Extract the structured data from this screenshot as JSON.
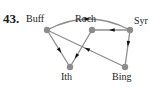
{
  "figure": {
    "problem_number": "43.",
    "type": "directed-graph",
    "width": 149,
    "height": 87,
    "background_color": "#ffffff",
    "node_color": "#8d8d8d",
    "edge_color": "#8d8d8d",
    "arrowhead_color": "#111111",
    "label_color": "#1a1a1a",
    "node_radius": 3.2,
    "edge_width": 1.3
  },
  "nodes": [
    {
      "id": "buff",
      "label": "Buff",
      "x": 47,
      "y": 30,
      "label_pos": "top-left"
    },
    {
      "id": "roch",
      "label": "Roch",
      "x": 92,
      "y": 30,
      "label_pos": "top"
    },
    {
      "id": "syr",
      "label": "Syr",
      "x": 130,
      "y": 30,
      "label_pos": "right"
    },
    {
      "id": "ith",
      "label": "Ith",
      "x": 70,
      "y": 67,
      "label_pos": "bottom"
    },
    {
      "id": "bing",
      "label": "Bing",
      "x": 125,
      "y": 67,
      "label_pos": "bottom"
    }
  ],
  "edges": [
    {
      "id": "buff-syr",
      "from": "buff",
      "to": "syr",
      "from_label": "Buff",
      "to_label": "Syr",
      "shape": "curved",
      "curvature": -22,
      "directed": true,
      "arrow_position": 0.52
    },
    {
      "id": "syr-roch",
      "from": "syr",
      "to": "roch",
      "from_label": "Syr",
      "to_label": "Roch",
      "shape": "straight",
      "directed": true,
      "arrow_position": 0.55
    },
    {
      "id": "buff-ith",
      "from": "buff",
      "to": "ith",
      "from_label": "Buff",
      "to_label": "Ith",
      "shape": "straight",
      "directed": true,
      "arrow_position": 0.62
    },
    {
      "id": "roch-ith",
      "from": "roch",
      "to": "ith",
      "from_label": "Roch",
      "to_label": "Ith",
      "shape": "straight",
      "directed": true,
      "arrow_position": 0.78
    },
    {
      "id": "syr-bing",
      "from": "syr",
      "to": "bing",
      "from_label": "Syr",
      "to_label": "Bing",
      "shape": "straight",
      "directed": true,
      "arrow_position": 0.45
    },
    {
      "id": "bing-buff",
      "from": "bing",
      "to": "buff",
      "from_label": "Bing",
      "to_label": "Buff",
      "shape": "straight",
      "directed": true,
      "arrow_position": 0.52
    }
  ]
}
